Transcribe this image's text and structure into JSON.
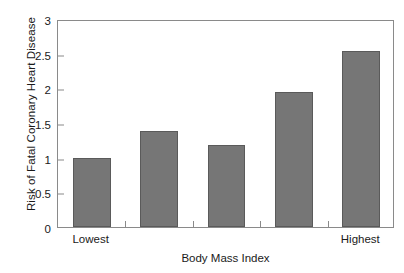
{
  "chart_data": {
    "type": "bar",
    "title": "",
    "subtitle": "",
    "xlabel": "Body Mass Index",
    "ylabel": "Risk of Fatal Coronary Heart Disease",
    "categories": [
      "Lowest",
      "",
      "",
      "",
      "Highest"
    ],
    "values": [
      1.0,
      1.4,
      1.2,
      1.96,
      2.57
    ],
    "ylim": [
      0,
      3
    ],
    "yticks": [
      0,
      0.5,
      1,
      1.5,
      2,
      2.5,
      3
    ],
    "ytick_labels": [
      "0",
      "0.5",
      "1",
      "1.5",
      "2",
      "2.5",
      "3"
    ],
    "xtick_labels": [
      "Lowest",
      "Highest"
    ],
    "grid": false,
    "legend": false,
    "legend_position": "none",
    "bar_color": "#767676",
    "bar_edge_color": "#5a5a5a",
    "axis_color": "#8a8a8a",
    "background_color": "#ffffff",
    "text_color": "#1a1a1a",
    "n_bars": 5,
    "annotations": []
  },
  "axes": {
    "y_title": "Risk of Fatal Coronary Heart Disease",
    "x_title": "Body Mass Index",
    "y_ticks": [
      {
        "label": "3",
        "value": 3
      },
      {
        "label": "2.5",
        "value": 2.5
      },
      {
        "label": "2",
        "value": 2
      },
      {
        "label": "1.5",
        "value": 1.5
      },
      {
        "label": "1",
        "value": 1
      },
      {
        "label": "0.5",
        "value": 0.5
      },
      {
        "label": "0",
        "value": 0
      }
    ],
    "x_labels": [
      {
        "label": "Lowest",
        "bar_index": 0
      },
      {
        "label": "Highest",
        "bar_index": 4
      }
    ]
  },
  "bars": [
    {
      "label": "Lowest",
      "value": 1.0
    },
    {
      "label": "",
      "value": 1.4
    },
    {
      "label": "",
      "value": 1.2
    },
    {
      "label": "",
      "value": 1.96
    },
    {
      "label": "Highest",
      "value": 2.57
    }
  ]
}
